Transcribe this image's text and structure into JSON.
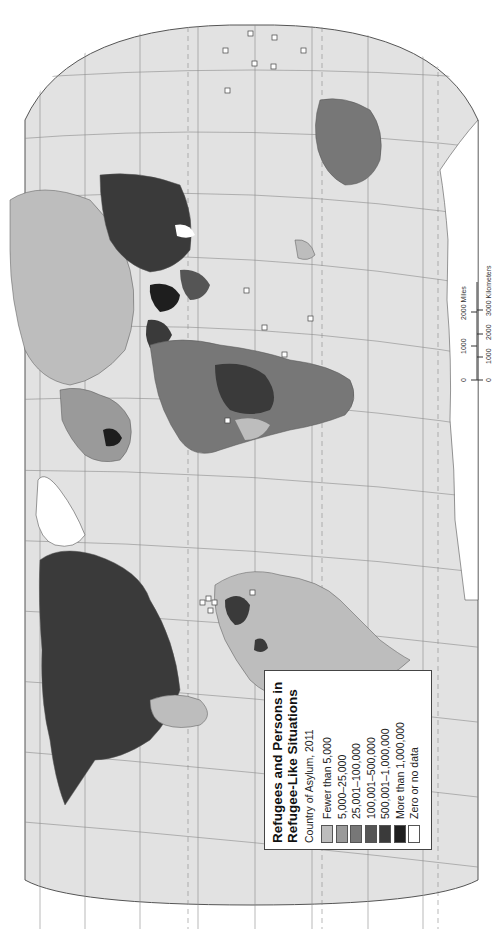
{
  "legend": {
    "title_line1": "Refugees and Persons in",
    "title_line2": "Refugee-Like Situations",
    "subtitle": "Country of Asylum, 2011",
    "items": [
      {
        "label": "Fewer than 5,000",
        "color": "#bdbdbd"
      },
      {
        "label": "5,000–25,000",
        "color": "#9a9a9a"
      },
      {
        "label": "25,001–100,000",
        "color": "#777777"
      },
      {
        "label": "100,001–500,000",
        "color": "#555555"
      },
      {
        "label": "500,001–1,000,000",
        "color": "#3a3a3a"
      },
      {
        "label": "More than 1,000,000",
        "color": "#1e1e1e"
      },
      {
        "label": "Zero or no data",
        "color": "#ffffff"
      }
    ]
  },
  "scale_bar": {
    "miles_ticks": [
      "0",
      "1000",
      "2000 Miles"
    ],
    "km_ticks": [
      "0",
      "1000",
      "2000",
      "3000 Kilometers"
    ]
  },
  "map": {
    "orientation": "rotated 90° counterclockwise (north to the left)",
    "ocean_color": "#e2e2e2",
    "graticule_color": "#8c8c8c",
    "outline_color": "#555555"
  }
}
